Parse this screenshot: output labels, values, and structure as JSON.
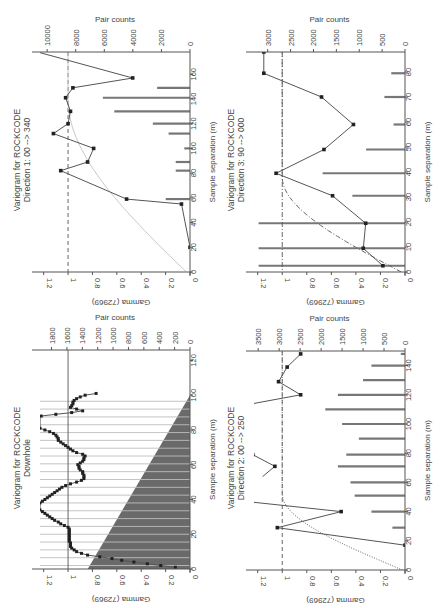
{
  "chart_data": [
    {
      "type": "line",
      "panel": "top-left",
      "title": "Variogram for ROCKCODE",
      "subtitle": "Direction 1: 00 --> 340",
      "xlabel": "Sample separation (m)",
      "ylabel": "Gamma (72969)",
      "y2label": "Pair counts",
      "xlim": [
        0,
        178
      ],
      "xticks": [
        0,
        20,
        40,
        60,
        80,
        100,
        120,
        140,
        160
      ],
      "ylim": [
        0,
        1.23
      ],
      "yticks": [
        0.0,
        0.2,
        0.4,
        0.6,
        0.8,
        1.0,
        1.2
      ],
      "y2lim": [
        0,
        10500
      ],
      "y2ticks": [
        0,
        2000,
        4000,
        6000,
        8000,
        10000
      ],
      "sill": 1.0,
      "sill_style": "dashed",
      "variogram": {
        "x": [
          20,
          55,
          59,
          82,
          89,
          100,
          112,
          120,
          130,
          141,
          149,
          157,
          178
        ],
        "y": [
          0.0,
          0.07,
          0.52,
          1.06,
          0.84,
          0.79,
          1.12,
          1.0,
          0.98,
          1.02,
          0.96,
          0.47,
          1.25
        ]
      },
      "model": {
        "style": "solid-light",
        "range": 140,
        "sill": 1.0,
        "nugget": 0.03
      },
      "pairs": {
        "x": [
          59,
          82,
          89,
          100,
          112,
          120,
          130,
          141,
          149
        ],
        "counts": [
          1700,
          1000,
          1000,
          400,
          1500,
          2600,
          5300,
          6100,
          2300
        ]
      }
    },
    {
      "type": "line",
      "panel": "top-right",
      "title": "Variogram for ROCKCODE",
      "subtitle": "Direction 3: 90 --> 000",
      "xlabel": "Sample separation (m)",
      "ylabel": "Gamma (72969)",
      "y2label": "Pair counts",
      "xlim": [
        0,
        88
      ],
      "xticks": [
        0,
        10,
        20,
        30,
        40,
        50,
        60,
        70,
        80
      ],
      "ylim": [
        0,
        1.23
      ],
      "yticks": [
        0.0,
        0.2,
        0.4,
        0.6,
        0.8,
        1.0,
        1.2
      ],
      "y2lim": [
        0,
        3300
      ],
      "y2ticks": [
        0,
        500,
        1000,
        1500,
        2000,
        2500,
        3000
      ],
      "sill": 1.0,
      "sill_style": "dashdot",
      "variogram": {
        "x": [
          2.5,
          9.5,
          19.5,
          30.5,
          39.5,
          49,
          59,
          70,
          79.5,
          88
        ],
        "y": [
          0.18,
          0.34,
          0.32,
          0.59,
          1.05,
          0.66,
          0.42,
          0.68,
          1.15,
          1.15
        ]
      },
      "model": {
        "style": "dashdot",
        "range": 38,
        "sill": 1.0,
        "nugget": 0.03
      },
      "pairs": {
        "x": [
          2.5,
          9.5,
          19.5,
          30.5,
          39.5,
          49,
          59,
          70,
          79.5
        ],
        "counts": [
          3200,
          3200,
          3200,
          1150,
          1800,
          850,
          250,
          450,
          300
        ]
      }
    },
    {
      "type": "line",
      "panel": "bottom-left",
      "title": "Variogram for ROCKCODE",
      "subtitle": "Downhole",
      "xlabel": "Sample separation (m)",
      "ylabel": "Gamma (72969)",
      "y2label": "Pair counts",
      "xlim": [
        0,
        126
      ],
      "xticks": [
        0,
        20,
        40,
        60,
        80,
        100,
        120
      ],
      "ylim": [
        0,
        1.23
      ],
      "yticks": [
        0.0,
        0.2,
        0.4,
        0.6,
        0.8,
        1.0,
        1.2
      ],
      "y2lim": [
        0,
        1950
      ],
      "y2ticks": [
        0,
        200,
        400,
        600,
        800,
        1000,
        1200,
        1400,
        1600,
        1800
      ],
      "sill": 1.0,
      "sill_style": "solid",
      "variogram": {
        "x": [
          1,
          2,
          3,
          4,
          5,
          6,
          7,
          8,
          9,
          10,
          11,
          12,
          13,
          14,
          15,
          16,
          17,
          18,
          19,
          20,
          21,
          22,
          23,
          24,
          25,
          26,
          27,
          28,
          29,
          30,
          31,
          32,
          33,
          34,
          35,
          36,
          37,
          38,
          39,
          40,
          41,
          42,
          43,
          44,
          45,
          46,
          47,
          48,
          49,
          50,
          51,
          52,
          53,
          54,
          55,
          56,
          57,
          58,
          59,
          60,
          61,
          62,
          63,
          64,
          65,
          66,
          67,
          68,
          69,
          70,
          71,
          72,
          73,
          74,
          75,
          76,
          77,
          78,
          79,
          80,
          81,
          82,
          83,
          84,
          85,
          86,
          87,
          88,
          89,
          90,
          91,
          92,
          93,
          94,
          95,
          96,
          97,
          98,
          99,
          100,
          101
        ],
        "y": [
          0.12,
          0.24,
          0.35,
          0.46,
          0.56,
          0.64,
          0.74,
          0.84,
          0.89,
          0.93,
          0.95,
          0.97,
          0.98,
          0.98,
          0.98,
          0.99,
          0.99,
          0.99,
          0.99,
          0.99,
          0.99,
          0.99,
          0.99,
          1.0,
          1.03,
          1.06,
          1.08,
          1.11,
          1.13,
          1.15,
          1.17,
          1.19,
          1.21,
          1.23,
          1.24,
          1.24,
          1.24,
          1.23,
          1.21,
          1.19,
          1.17,
          1.15,
          1.13,
          1.11,
          1.09,
          1.07,
          1.05,
          1.02,
          0.98,
          0.93,
          0.89,
          0.87,
          0.87,
          0.87,
          0.88,
          0.88,
          0.9,
          0.91,
          0.91,
          0.92,
          0.9,
          0.88,
          0.87,
          0.87,
          0.86,
          0.88,
          0.93,
          0.96,
          0.98,
          1.0,
          1.02,
          1.04,
          1.06,
          1.08,
          1.08,
          1.09,
          1.1,
          1.12,
          1.15,
          1.19,
          1.23,
          1.24,
          1.24,
          1.24,
          1.24,
          1.24,
          1.24,
          1.22,
          1.1,
          0.97,
          0.88,
          0.93,
          0.98,
          0.97,
          0.96,
          0.96,
          0.95,
          0.93,
          0.9,
          0.86,
          0.77
        ]
      },
      "model": null,
      "pairs": {
        "style": "filled-area",
        "x": [
          0,
          100
        ],
        "counts": [
          1330,
          0
        ]
      }
    },
    {
      "type": "line",
      "panel": "bottom-right",
      "title": "Variogram for ROCKCODE",
      "subtitle": "Direction 2: 00 --> 250",
      "xlabel": "Sample separation (m)",
      "ylabel": "Gamma (72969)",
      "y2label": "Pair counts",
      "xlim": [
        0,
        150
      ],
      "xticks": [
        0,
        20,
        40,
        60,
        80,
        100,
        120,
        140
      ],
      "ylim": [
        0,
        1.23
      ],
      "yticks": [
        0.0,
        0.2,
        0.4,
        0.6,
        0.8,
        1.0,
        1.2
      ],
      "y2lim": [
        0,
        3600
      ],
      "y2ticks": [
        0,
        500,
        1000,
        1500,
        2000,
        2500,
        3000,
        3500
      ],
      "sill": 1.0,
      "sill_style": "dashed",
      "variogram": {
        "segments": [
          {
            "x": [
              17,
              29,
              40,
              47
            ],
            "y": [
              0.0,
              1.04,
              0.52,
              1.3
            ]
          },
          {
            "x": [
              64,
              71,
              79
            ],
            "y": [
              1.16,
              1.06,
              1.24
            ]
          },
          {
            "x": [
              113,
              120,
              129,
              139,
              148
            ],
            "y": [
              1.3,
              0.85,
              1.03,
              0.96,
              0.85
            ]
          }
        ],
        "markers_x": [
          17,
          29,
          40,
          71,
          79,
          120,
          129,
          139,
          148
        ],
        "markers_y": [
          0.0,
          1.04,
          0.52,
          1.06,
          1.24,
          0.85,
          1.03,
          0.96,
          0.85
        ]
      },
      "model": {
        "style": "dotted",
        "range": 52,
        "sill": 1.0,
        "nugget": 0.02
      },
      "pairs": {
        "x": [
          29,
          40,
          51,
          60,
          71,
          79,
          90,
          100,
          110,
          120,
          130,
          140,
          148
        ],
        "counts": [
          300,
          800,
          1200,
          1300,
          1600,
          1400,
          1100,
          1500,
          1900,
          1600,
          1000,
          800,
          100
        ]
      }
    }
  ],
  "panels_layout": [
    {
      "box": {
        "left": 40,
        "right": 190,
        "top": 52,
        "bottom": 272
      },
      "title_x": 20,
      "title_cy": 160
    },
    {
      "box": {
        "left": 254,
        "right": 405,
        "top": 52,
        "bottom": 272
      },
      "title_x": 234,
      "title_cy": 160
    },
    {
      "box": {
        "left": 40,
        "right": 190,
        "top": 350,
        "bottom": 569
      },
      "title_x": 20,
      "title_cy": 458
    },
    {
      "box": {
        "left": 254,
        "right": 405,
        "top": 351,
        "bottom": 570
      },
      "title_x": 234,
      "title_cy": 458
    }
  ],
  "colors": {
    "axis": "#555555",
    "line": "#555555",
    "marker": "#222222",
    "bar": "#777777",
    "area": "#6a6a6a",
    "model_light": "#c8c8c8",
    "model_dark": "#666666"
  }
}
